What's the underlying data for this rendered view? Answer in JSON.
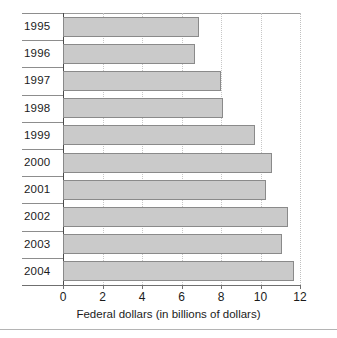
{
  "chart_data": {
    "type": "bar",
    "orientation": "horizontal",
    "title": "",
    "xlabel": "Federal dollars (in billions of dollars)",
    "ylabel": "",
    "categories": [
      "1995",
      "1996",
      "1997",
      "1998",
      "1999",
      "2000",
      "2001",
      "2002",
      "2003",
      "2004"
    ],
    "values": [
      6.9,
      6.7,
      8.0,
      8.1,
      9.7,
      10.6,
      10.3,
      11.4,
      11.1,
      11.7
    ],
    "xlim": [
      0,
      12
    ],
    "xticks": [
      0,
      2,
      4,
      6,
      8,
      10,
      12
    ],
    "xtick_labels": [
      "0",
      "2",
      "4",
      "6",
      "8",
      "10",
      "12"
    ],
    "grid": "vertical-dotted",
    "legend": "none",
    "bar_fill_color": "#cacaca",
    "bar_border_color": "#8a8a8a",
    "axis_color": "#4a4a4a",
    "gridline_color": "#c7c7c7",
    "text_color": "#1b1b1b"
  }
}
